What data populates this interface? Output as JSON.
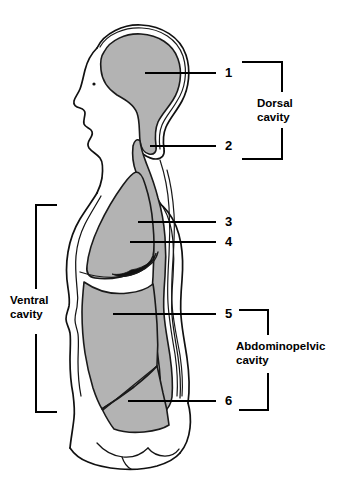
{
  "figure": {
    "view": "sagittal-lateral",
    "colors": {
      "cavity_fill": "#b3b3b3",
      "outline": "#111111",
      "leader": "#000000",
      "background": "#ffffff"
    }
  },
  "number_labels": [
    {
      "id": "1",
      "text": "1",
      "points_to": "cranial-cavity"
    },
    {
      "id": "2",
      "text": "2",
      "points_to": "spinal-cavity"
    },
    {
      "id": "3",
      "text": "3",
      "points_to": "thoracic-cavity"
    },
    {
      "id": "4",
      "text": "4",
      "points_to": "diaphragm"
    },
    {
      "id": "5",
      "text": "5",
      "points_to": "abdominal-cavity"
    },
    {
      "id": "6",
      "text": "6",
      "points_to": "pelvic-cavity"
    }
  ],
  "brackets": [
    {
      "id": "dorsal",
      "label_line1": "Dorsal",
      "label_line2": "cavity",
      "side": "right",
      "covers": [
        "1",
        "2"
      ]
    },
    {
      "id": "ventral",
      "label_line1": "Ventral",
      "label_line2": "cavity",
      "side": "left",
      "covers": [
        "3",
        "4",
        "5",
        "6"
      ]
    },
    {
      "id": "abdominopelvic",
      "label_line1": "Abdominopelvic",
      "label_line2": "cavity",
      "side": "right",
      "covers": [
        "5",
        "6"
      ]
    }
  ],
  "regions": [
    {
      "name": "cranial-cavity",
      "shaded": true
    },
    {
      "name": "spinal-cavity",
      "shaded": true
    },
    {
      "name": "thoracic-cavity",
      "shaded": true
    },
    {
      "name": "diaphragm",
      "shaded": false
    },
    {
      "name": "abdominal-cavity",
      "shaded": true
    },
    {
      "name": "pelvic-cavity",
      "shaded": true
    }
  ]
}
